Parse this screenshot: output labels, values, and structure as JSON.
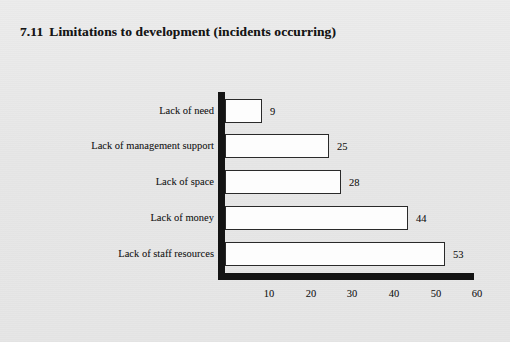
{
  "title": {
    "number": "7.11",
    "text": "Limitations to development (incidents occurring)",
    "full": "7.11  Limitations to development (incidents occurring)"
  },
  "colors": {
    "background": "#e9e9e9",
    "axis": "#141414",
    "bar_fill": "#fdfdfd",
    "bar_outline": "#2a2a2a",
    "text": "#1b1b1b"
  },
  "chart_data": {
    "type": "bar",
    "orientation": "horizontal",
    "xlabel": "",
    "ylabel": "",
    "categories": [
      "Lack of need",
      "Lack of management support",
      "Lack of space",
      "Lack of money",
      "Lack of staff resources"
    ],
    "values": [
      9,
      25,
      28,
      44,
      53
    ],
    "data_labels": [
      "9",
      "25",
      "28",
      "44",
      "53"
    ],
    "xlim": [
      0,
      60
    ],
    "xticks": [
      10,
      20,
      30,
      40,
      50,
      60
    ],
    "xtick_labels": [
      "10",
      "20",
      "30",
      "40",
      "50",
      "60"
    ],
    "grid": false,
    "legend": false
  }
}
